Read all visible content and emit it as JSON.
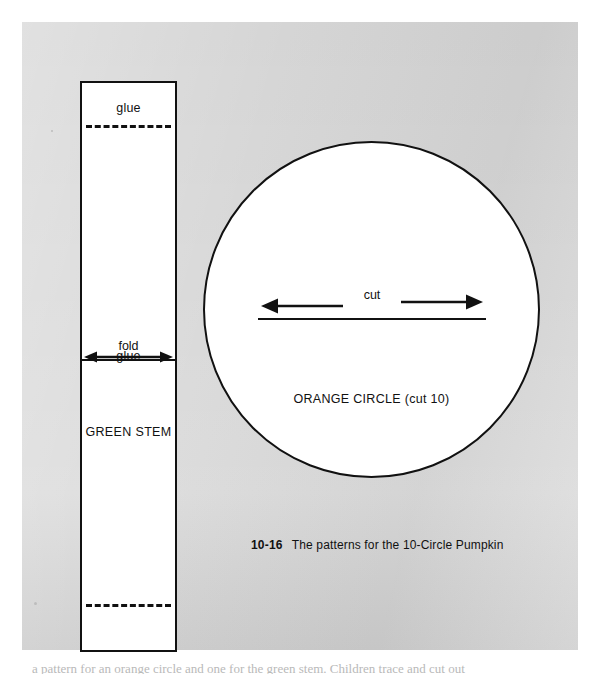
{
  "page": {
    "background_color": "#ffffff",
    "sheet_color": "#d8d8d8",
    "ink_color": "#111111"
  },
  "stem_pattern": {
    "name": "green-stem-strip",
    "glue_top_label": "glue",
    "glue_bottom_label": "glue",
    "fold_label": "fold",
    "stem_label": "GREEN STEM"
  },
  "circle_pattern": {
    "name": "orange-circle",
    "cut_label": "cut",
    "circle_label": "ORANGE CIRCLE (cut 10)"
  },
  "figure_caption": {
    "number": "10-16",
    "text": "The patterns for the 10-Circle Pumpkin"
  },
  "bottom_text": {
    "cropped_line": "a pattern for an orange circle and one for the green stem. Children trace and cut out"
  }
}
